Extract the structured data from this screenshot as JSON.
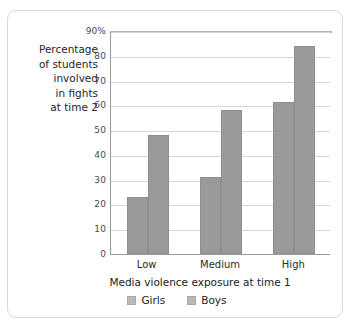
{
  "chart_data": {
    "type": "bar",
    "title": "",
    "categories": [
      "Low",
      "Medium",
      "High"
    ],
    "series": [
      {
        "name": "Girls",
        "values": [
          23,
          31,
          61.5
        ],
        "color": "#9a9a9a"
      },
      {
        "name": "Boys",
        "values": [
          48,
          58,
          84
        ],
        "color": "#9a9a9a"
      }
    ],
    "xlabel": "Media violence exposure at time 1",
    "ylabel": "Percentage of students involved in fights at time 2",
    "ylabel_lines": [
      "Percentage",
      "of students",
      "involved",
      "in fights",
      "at time 2"
    ],
    "ylim": [
      0,
      90
    ],
    "yticks": [
      0,
      10,
      20,
      30,
      40,
      50,
      60,
      70,
      80,
      90
    ],
    "ytick_labels": [
      "0",
      "10",
      "20",
      "30",
      "40",
      "50",
      "60",
      "70",
      "80",
      "90%"
    ],
    "grid": "horizontal",
    "legend_position": "bottom",
    "legend": [
      "Girls",
      "Boys"
    ],
    "axis_color": "#9b9b9b",
    "grid_color": "#d6d6d6",
    "frame_color": "#d8d8d8"
  }
}
